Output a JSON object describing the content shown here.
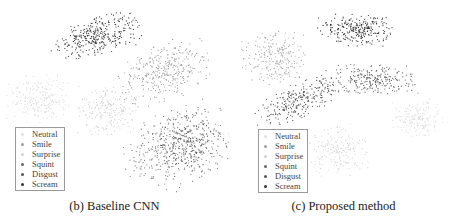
{
  "chart_data": [
    {
      "type": "scatter",
      "title": "",
      "caption": "(b) Baseline CNN",
      "xlabel": "",
      "ylabel": "",
      "grid": false,
      "axes": false,
      "legend_position": "lower-left",
      "legend": [
        "Neutral",
        "Smile",
        "Surprise",
        "Squint",
        "Disgust",
        "Scream"
      ],
      "series": [
        {
          "name": "Scream",
          "color": "#333333",
          "cluster": {
            "cx": 98,
            "cy": 36,
            "rx": 40,
            "ry": 17,
            "tilt": -15,
            "n": 320
          }
        },
        {
          "name": "Smile",
          "color": "#9a9a9a",
          "cluster": {
            "cx": 164,
            "cy": 72,
            "rx": 44,
            "ry": 26,
            "tilt": -20,
            "n": 320
          }
        },
        {
          "name": "Neutral",
          "color": "#dcdcdc",
          "cluster": {
            "cx": 40,
            "cy": 98,
            "rx": 30,
            "ry": 22,
            "tilt": 0,
            "n": 220
          }
        },
        {
          "name": "Surprise",
          "color": "#d0d0d0",
          "cluster": {
            "cx": 108,
            "cy": 110,
            "rx": 30,
            "ry": 24,
            "tilt": 0,
            "n": 200
          }
        },
        {
          "name": "Squint",
          "color": "#777777",
          "cluster": {
            "cx": 178,
            "cy": 148,
            "rx": 52,
            "ry": 34,
            "tilt": -25,
            "n": 400
          }
        },
        {
          "name": "Disgust",
          "color": "#555555",
          "cluster": {
            "cx": 190,
            "cy": 140,
            "rx": 30,
            "ry": 26,
            "tilt": -25,
            "n": 160
          }
        }
      ],
      "legend_box": {
        "left": 15,
        "top": 127
      }
    },
    {
      "type": "scatter",
      "title": "",
      "caption": "(c) Proposed method",
      "xlabel": "",
      "ylabel": "",
      "grid": false,
      "axes": false,
      "legend_position": "lower-left",
      "legend": [
        "Neutral",
        "Smile",
        "Surprise",
        "Squint",
        "Disgust",
        "Scream"
      ],
      "series": [
        {
          "name": "Scream",
          "color": "#333333",
          "cluster": {
            "cx": 128,
            "cy": 30,
            "rx": 34,
            "ry": 15,
            "tilt": 0,
            "n": 260
          }
        },
        {
          "name": "Smile",
          "color": "#a8a8a8",
          "cluster": {
            "cx": 45,
            "cy": 58,
            "rx": 30,
            "ry": 24,
            "tilt": 0,
            "n": 230
          }
        },
        {
          "name": "Squint",
          "color": "#666666",
          "cluster": {
            "cx": 140,
            "cy": 80,
            "rx": 45,
            "ry": 14,
            "tilt": 0,
            "n": 260
          }
        },
        {
          "name": "Disgust",
          "color": "#555555",
          "cluster": {
            "cx": 70,
            "cy": 100,
            "rx": 42,
            "ry": 16,
            "tilt": -25,
            "n": 260
          }
        },
        {
          "name": "Neutral",
          "color": "#dddddd",
          "cluster": {
            "cx": 190,
            "cy": 118,
            "rx": 24,
            "ry": 18,
            "tilt": 0,
            "n": 180
          }
        },
        {
          "name": "Surprise",
          "color": "#d5d5d5",
          "cluster": {
            "cx": 106,
            "cy": 150,
            "rx": 30,
            "ry": 24,
            "tilt": 0,
            "n": 180
          }
        }
      ],
      "legend_box": {
        "left": 29,
        "top": 129
      }
    }
  ],
  "legend_colors": {
    "Neutral": "#e0e0e0",
    "Smile": "#a0a0a0",
    "Surprise": "#d0d0d0",
    "Squint": "#666666",
    "Disgust": "#555555",
    "Scream": "#333333"
  }
}
